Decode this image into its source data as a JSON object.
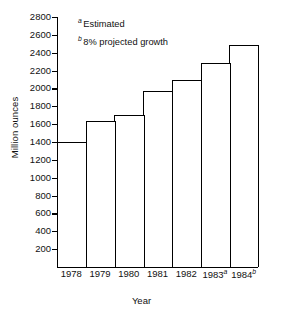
{
  "chart_data": {
    "type": "bar",
    "title": "",
    "xlabel": "Year",
    "ylabel": "Million ounces",
    "categories": [
      "1978",
      "1979",
      "1980",
      "1981",
      "1982",
      "1983",
      "1984"
    ],
    "category_marks": [
      "",
      "",
      "",
      "",
      "",
      "a",
      "b"
    ],
    "values": [
      1400,
      1630,
      1700,
      1970,
      2100,
      2280,
      2490
    ],
    "ylim": [
      0,
      2800
    ],
    "ytick_values": [
      200,
      400,
      600,
      800,
      1000,
      1200,
      1400,
      1600,
      1800,
      2000,
      2200,
      2400,
      2600,
      2800
    ],
    "ytick_labels": [
      "200",
      "400",
      "600",
      "800",
      "1000",
      "1200",
      "1400",
      "1600",
      "1800",
      "2000",
      "2200",
      "2400",
      "2600",
      "2800"
    ],
    "grid": false,
    "legend": "none",
    "bar_style": {
      "fill": "#ffffff",
      "edge": "#000000",
      "contiguous": true
    },
    "annotations": [
      {
        "mark": "a",
        "text": "Estimated"
      },
      {
        "mark": "b",
        "text": "8% projected growth"
      }
    ]
  },
  "colors": {
    "background": "#ffffff",
    "axis": "#000000",
    "text": "#111111",
    "bar_fill": "#ffffff",
    "bar_edge": "#000000"
  }
}
